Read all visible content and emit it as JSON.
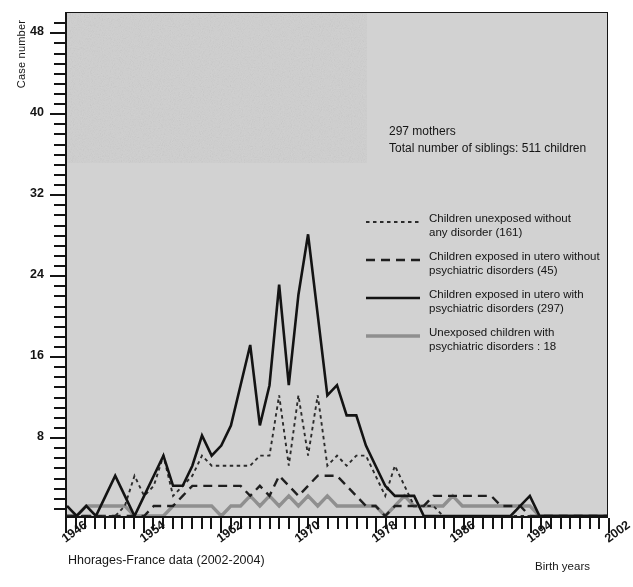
{
  "axes": {
    "ylabel": "Case number",
    "xlabel": "Birth years",
    "y_ticks": [
      8,
      16,
      24,
      32,
      40,
      48
    ],
    "x_ticks": [
      1946,
      1954,
      1962,
      1970,
      1978,
      1986,
      1994,
      2002
    ]
  },
  "annotation": {
    "line1": "297 mothers",
    "line2": "Total number of siblings: 511 children"
  },
  "source_note": "Hhorages-France data (2002-2004)",
  "legend": [
    {
      "style": "dotted",
      "color": "#2b2b2b",
      "line1": "Children unexposed without",
      "line2": "any disorder (161)"
    },
    {
      "style": "dashed",
      "color": "#1f1f1f",
      "line1": "Children exposed in utero without",
      "line2": "psychiatric disorders (45)"
    },
    {
      "style": "solid",
      "color": "#131313",
      "line1": "Children exposed in utero with",
      "line2": "psychiatric disorders (297)"
    },
    {
      "style": "solid-gray",
      "color": "#8f8f8f",
      "line1": "Unexposed children with",
      "line2": "psychiatric disorders : 18"
    }
  ],
  "chart_data": {
    "type": "line",
    "title": "",
    "xlabel": "Birth years",
    "ylabel": "Case number",
    "xlim": [
      1946,
      2002
    ],
    "ylim": [
      0,
      50
    ],
    "y_ticks": [
      8,
      16,
      24,
      32,
      40,
      48
    ],
    "x_ticks": [
      1946,
      1954,
      1962,
      1970,
      1978,
      1986,
      1994,
      2002
    ],
    "minor_tick_interval": 1,
    "grid": false,
    "legend_position": "inside-right",
    "annotations": [
      "297 mothers",
      "Total number of siblings: 511 children",
      "Hhorages-France data (2002-2004)"
    ],
    "x": [
      1946,
      1947,
      1948,
      1949,
      1950,
      1951,
      1952,
      1953,
      1954,
      1955,
      1956,
      1957,
      1958,
      1959,
      1960,
      1961,
      1962,
      1963,
      1964,
      1965,
      1966,
      1967,
      1968,
      1969,
      1970,
      1971,
      1972,
      1973,
      1974,
      1975,
      1976,
      1977,
      1978,
      1979,
      1980,
      1981,
      1982,
      1983,
      1984,
      1985,
      1986,
      1987,
      1988,
      1989,
      1990,
      1991,
      1992,
      1993,
      1994,
      1995,
      1996,
      1997,
      1998,
      1999,
      2000,
      2001,
      2002
    ],
    "series": [
      {
        "name": "Children exposed in utero with psychiatric disorders (297)",
        "style": "solid",
        "color": "#131313",
        "values": [
          1,
          0,
          1,
          0,
          2,
          4,
          2,
          0,
          2,
          4,
          6,
          3,
          3,
          5,
          8,
          6,
          7,
          9,
          13,
          17,
          9,
          13,
          23,
          13,
          22,
          28,
          20,
          12,
          13,
          10,
          10,
          7,
          5,
          3,
          2,
          2,
          2,
          0,
          0,
          0,
          0,
          0,
          0,
          0,
          0,
          0,
          0,
          1,
          2,
          0,
          0,
          0,
          0,
          0,
          0,
          0,
          0
        ]
      },
      {
        "name": "Children unexposed without any disorder (161)",
        "style": "dotted",
        "color": "#2b2b2b",
        "values": [
          0,
          0,
          0,
          0,
          0,
          0,
          1,
          4,
          2,
          3,
          6,
          2,
          3,
          4,
          6,
          5,
          5,
          5,
          5,
          5,
          6,
          6,
          12,
          5,
          12,
          6,
          12,
          5,
          6,
          5,
          6,
          6,
          4,
          2,
          5,
          3,
          1,
          1,
          1,
          0,
          0,
          0,
          0,
          0,
          0,
          0,
          0,
          0,
          0,
          0,
          0,
          0,
          0,
          0,
          0,
          0,
          0
        ]
      },
      {
        "name": "Children exposed in utero without psychiatric disorders (45)",
        "style": "dashed",
        "color": "#1f1f1f",
        "values": [
          0,
          0,
          0,
          0,
          0,
          0,
          0,
          0,
          0,
          1,
          1,
          1,
          2,
          3,
          3,
          3,
          3,
          3,
          3,
          2,
          3,
          2,
          4,
          3,
          2,
          3,
          4,
          4,
          4,
          3,
          2,
          1,
          1,
          0,
          1,
          1,
          1,
          1,
          2,
          2,
          2,
          2,
          2,
          2,
          2,
          1,
          1,
          1,
          0,
          0,
          0,
          0,
          0,
          0,
          0,
          0,
          0
        ]
      },
      {
        "name": "Unexposed children with psychiatric disorders : 18",
        "style": "solid-gray",
        "color": "#8f8f8f",
        "values": [
          0,
          0,
          1,
          1,
          1,
          1,
          1,
          0,
          0,
          0,
          0,
          1,
          1,
          1,
          1,
          1,
          0,
          1,
          1,
          2,
          1,
          2,
          1,
          2,
          1,
          2,
          1,
          2,
          1,
          1,
          1,
          1,
          1,
          0,
          1,
          2,
          1,
          1,
          1,
          1,
          2,
          1,
          1,
          1,
          1,
          1,
          1,
          1,
          1,
          0,
          0,
          0,
          0,
          0,
          0,
          0,
          0
        ]
      }
    ]
  }
}
